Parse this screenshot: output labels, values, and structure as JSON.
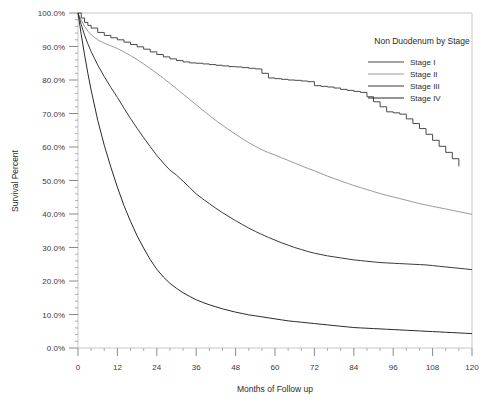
{
  "chart_data": {
    "type": "line",
    "title": "",
    "xlabel": "Months of Follow up",
    "ylabel": "Survival Percent",
    "xlim": [
      0,
      120
    ],
    "ylim": [
      0,
      100
    ],
    "grid": false,
    "legend_position": "top-right",
    "legend_title": "Non Duodenum by Stage",
    "x_tick_labels": [
      "0",
      "12",
      "24",
      "36",
      "48",
      "60",
      "72",
      "84",
      "96",
      "108",
      "120"
    ],
    "x_ticks": [
      0,
      12,
      24,
      36,
      48,
      60,
      72,
      84,
      96,
      108,
      120
    ],
    "x_minor_tick_interval": 4,
    "y_tick_labels": [
      "0.0%",
      "10.0%",
      "20.0%",
      "30.0%",
      "40.0%",
      "50.0%",
      "60.0%",
      "70.0%",
      "80.0%",
      "90.0%",
      "100.0%"
    ],
    "y_ticks": [
      0,
      10,
      20,
      30,
      40,
      50,
      60,
      70,
      80,
      90,
      100
    ],
    "y_minor_tick_interval": 2,
    "series": [
      {
        "name": "Stage I",
        "color": "#4a4a4a",
        "step": true,
        "x": [
          0,
          1,
          2,
          3,
          4,
          6,
          8,
          10,
          12,
          14,
          16,
          18,
          20,
          22,
          24,
          26,
          28,
          30,
          32,
          34,
          36,
          38,
          40,
          42,
          44,
          46,
          48,
          50,
          52,
          54,
          56,
          58,
          60,
          62,
          64,
          66,
          68,
          70,
          72,
          74,
          76,
          78,
          80,
          82,
          84,
          86,
          88,
          90,
          92,
          94,
          96,
          98,
          100,
          102,
          104,
          106,
          108,
          110,
          112,
          114,
          116
        ],
        "y": [
          100,
          98.5,
          97.2,
          96.3,
          95.5,
          94.2,
          93.3,
          92.6,
          92.0,
          91.3,
          90.6,
          89.9,
          89.2,
          88.4,
          87.6,
          86.9,
          86.3,
          85.8,
          85.4,
          85.1,
          85.0,
          84.8,
          84.6,
          84.4,
          84.2,
          84.0,
          83.9,
          83.7,
          83.5,
          83.3,
          82.0,
          80.6,
          80.4,
          80.2,
          80.0,
          79.9,
          79.7,
          79.5,
          78.3,
          78.1,
          77.9,
          77.6,
          77.2,
          76.9,
          76.6,
          76.3,
          75.0,
          73.5,
          72.0,
          70.5,
          70.2,
          69.8,
          68.4,
          67.0,
          65.5,
          63.8,
          62.0,
          60.2,
          58.4,
          56.5,
          54.2
        ]
      },
      {
        "name": "Stage II",
        "color": "#9a9a9a",
        "step": false,
        "x": [
          0,
          1,
          2,
          3,
          4,
          6,
          8,
          10,
          12,
          14,
          16,
          18,
          20,
          22,
          24,
          26,
          28,
          30,
          32,
          34,
          36,
          38,
          40,
          42,
          44,
          46,
          48,
          50,
          52,
          54,
          56,
          58,
          60,
          62,
          64,
          66,
          68,
          70,
          72,
          74,
          76,
          78,
          80,
          82,
          84,
          86,
          88,
          90,
          92,
          94,
          96,
          98,
          100,
          102,
          104,
          106,
          108,
          110,
          112,
          114,
          116,
          118,
          120
        ],
        "y": [
          100,
          97.8,
          96.0,
          94.6,
          93.5,
          92.0,
          91.0,
          90.2,
          89.4,
          88.4,
          87.3,
          86.1,
          84.8,
          83.4,
          82.0,
          80.5,
          79.0,
          77.4,
          75.8,
          74.2,
          72.6,
          71.0,
          69.4,
          67.9,
          66.5,
          65.1,
          63.8,
          62.5,
          61.3,
          60.2,
          59.2,
          58.3,
          57.6,
          56.8,
          56.0,
          55.2,
          54.4,
          53.6,
          52.9,
          52.1,
          51.3,
          50.6,
          49.9,
          49.2,
          48.5,
          47.9,
          47.3,
          46.7,
          46.1,
          45.6,
          45.1,
          44.6,
          44.1,
          43.6,
          43.1,
          42.7,
          42.3,
          41.9,
          41.5,
          41.1,
          40.7,
          40.3,
          39.9
        ]
      },
      {
        "name": "Stage III",
        "color": "#3a3a3a",
        "step": false,
        "x": [
          0,
          1,
          2,
          3,
          4,
          6,
          8,
          10,
          12,
          14,
          16,
          18,
          20,
          22,
          24,
          26,
          28,
          30,
          32,
          34,
          36,
          38,
          40,
          42,
          44,
          46,
          48,
          50,
          52,
          54,
          56,
          58,
          60,
          62,
          64,
          66,
          68,
          70,
          72,
          74,
          76,
          78,
          80,
          82,
          84,
          86,
          88,
          90,
          92,
          94,
          96,
          98,
          100,
          102,
          104,
          106,
          108,
          110,
          112,
          114,
          116,
          118,
          120
        ],
        "y": [
          100,
          96.5,
          93.4,
          90.8,
          88.5,
          84.5,
          81.0,
          77.8,
          74.8,
          71.6,
          68.5,
          65.6,
          62.8,
          60.1,
          57.5,
          55.2,
          53.1,
          51.6,
          49.8,
          47.9,
          46.0,
          44.5,
          43.1,
          41.7,
          40.4,
          39.2,
          38.0,
          36.9,
          35.8,
          34.8,
          33.9,
          33.0,
          32.2,
          31.4,
          30.7,
          30.0,
          29.4,
          28.8,
          28.3,
          27.9,
          27.5,
          27.2,
          26.9,
          26.6,
          26.3,
          26.1,
          25.9,
          25.7,
          25.5,
          25.4,
          25.3,
          25.2,
          25.1,
          25.0,
          24.9,
          24.8,
          24.6,
          24.4,
          24.2,
          24.0,
          23.8,
          23.6,
          23.4
        ]
      },
      {
        "name": "Stage IV",
        "color": "#2a2a2a",
        "step": false,
        "x": [
          0,
          1,
          2,
          3,
          4,
          6,
          8,
          10,
          12,
          14,
          16,
          18,
          20,
          22,
          24,
          26,
          28,
          30,
          32,
          34,
          36,
          38,
          40,
          42,
          44,
          46,
          48,
          50,
          52,
          54,
          56,
          58,
          60,
          62,
          64,
          66,
          68,
          70,
          72,
          74,
          76,
          78,
          80,
          82,
          84,
          86,
          88,
          90,
          92,
          94,
          96,
          98,
          100,
          102,
          104,
          106,
          108,
          110,
          112,
          114,
          116,
          118,
          120
        ],
        "y": [
          100,
          93.5,
          87.5,
          82.0,
          77.0,
          68.0,
          60.5,
          54.0,
          48.0,
          42.5,
          37.8,
          33.5,
          29.8,
          26.4,
          23.5,
          21.2,
          19.3,
          17.8,
          16.5,
          15.4,
          14.4,
          13.6,
          12.9,
          12.3,
          11.7,
          11.2,
          10.7,
          10.3,
          9.9,
          9.6,
          9.3,
          9.0,
          8.7,
          8.4,
          8.1,
          7.9,
          7.7,
          7.5,
          7.3,
          7.1,
          6.9,
          6.7,
          6.5,
          6.3,
          6.1,
          6.0,
          5.9,
          5.8,
          5.7,
          5.6,
          5.5,
          5.4,
          5.3,
          5.2,
          5.1,
          5.0,
          4.9,
          4.8,
          4.7,
          4.6,
          4.5,
          4.4,
          4.3
        ]
      }
    ]
  },
  "legend": {
    "title": "Non Duodenum by Stage",
    "entries": [
      {
        "label": "Stage I",
        "color": "#4a4a4a"
      },
      {
        "label": "Stage II",
        "color": "#9a9a9a"
      },
      {
        "label": "Stage III",
        "color": "#3a3a3a"
      },
      {
        "label": "Stage IV",
        "color": "#2a2a2a"
      }
    ]
  }
}
